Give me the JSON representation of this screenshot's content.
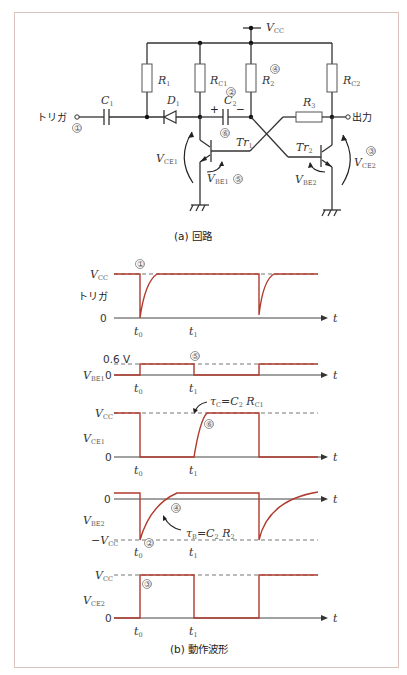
{
  "circuit": {
    "caption": "(a) 回路",
    "labels": {
      "vcc": "V",
      "vcc_sub": "CC",
      "r1": "R",
      "r1_sub": "1",
      "rc1": "R",
      "rc1_sub": "C1",
      "r2": "R",
      "r2_sub": "2",
      "rc2": "R",
      "rc2_sub": "C2",
      "r3": "R",
      "r3_sub": "3",
      "c1": "C",
      "c1_sub": "1",
      "c2": "C",
      "c2_sub": "2",
      "d1": "D",
      "d1_sub": "1",
      "tr1": "Tr",
      "tr1_sub": "1",
      "tr2": "Tr",
      "tr2_sub": "2",
      "vce1": "V",
      "vce1_sub": "CE1",
      "vbe1": "V",
      "vbe1_sub": "BE1",
      "vbe2": "V",
      "vbe2_sub": "BE2",
      "vce2": "V",
      "vce2_sub": "CE2",
      "trigger": "トリガ",
      "output": "出力",
      "plus": "+",
      "minus": "−",
      "markers": [
        "①",
        "②",
        "③",
        "④",
        "⑤",
        "⑥"
      ]
    }
  },
  "waveforms": {
    "caption": "(b) 動作波形",
    "axis_label": "t",
    "t0": "t",
    "t0_sub": "0",
    "t1": "t",
    "t1_sub": "1",
    "panels": [
      {
        "name": "trigger",
        "ylabel": "トリガ",
        "top": "V",
        "top_sub": "CC",
        "bottom": "0",
        "marker": "①"
      },
      {
        "name": "vbe1",
        "ylabel": "V",
        "ylabel_sub": "BE1",
        "top": "0.6 V",
        "bottom": "0",
        "marker": "⑤"
      },
      {
        "name": "vce1",
        "ylabel": "V",
        "ylabel_sub": "CE1",
        "top": "V",
        "top_sub": "CC",
        "bottom": "0",
        "marker": "⑥",
        "annotation": "τ",
        "annotation_sub": "C",
        "annotation_rhs": "=C",
        "annotation_rhs_sub": "2",
        "annotation_r": " R",
        "annotation_r_sub": "C1"
      },
      {
        "name": "vbe2",
        "ylabel": "V",
        "ylabel_sub": "BE2",
        "top": "0",
        "bottom": "−V",
        "bottom_sub": "CC",
        "markers": [
          "④",
          "②"
        ],
        "annotation": "τ",
        "annotation_sub": "B",
        "annotation_rhs": "=C",
        "annotation_rhs_sub": "2",
        "annotation_r": " R",
        "annotation_r_sub": "2"
      },
      {
        "name": "vce2",
        "ylabel": "V",
        "ylabel_sub": "CE2",
        "top": "V",
        "top_sub": "CC",
        "bottom": "0",
        "marker": "③"
      }
    ]
  },
  "colors": {
    "waveform": "#b03a2e",
    "frame": "#d9c3bd"
  }
}
